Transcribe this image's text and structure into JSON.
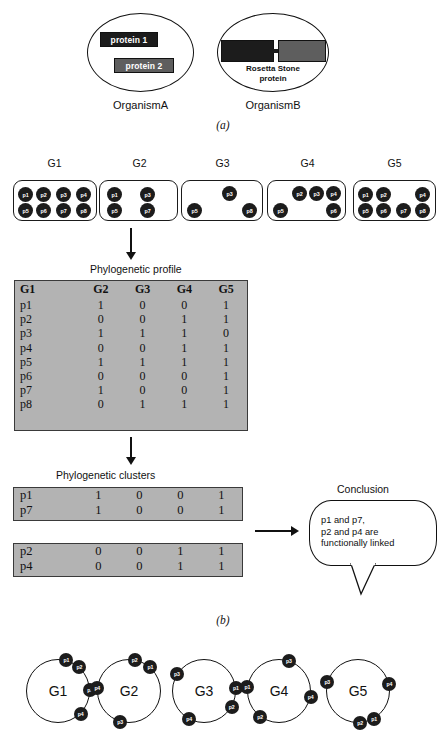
{
  "panel_a": {
    "caption": "(a)",
    "organism_a": {
      "label": "OrganismA",
      "proteins": [
        {
          "name": "protein 1",
          "shade": "#1c1c1c"
        },
        {
          "name": "protein 2",
          "shade": "#5e5e5e"
        }
      ]
    },
    "organism_b": {
      "label": "OrganismB",
      "fusion_label_line1": "Rosetta Stone",
      "fusion_label_line2": "protein",
      "segments": [
        {
          "shade": "#1c1c1c"
        },
        {
          "shade": "#5e5e5e"
        }
      ]
    }
  },
  "panel_b": {
    "caption": "(b)",
    "genomes": [
      {
        "name": "G1",
        "proteins": [
          "p1",
          "p2",
          "p3",
          "p4",
          "p5",
          "p6",
          "p7",
          "p8"
        ]
      },
      {
        "name": "G2",
        "proteins": [
          "p1",
          "p3",
          "p5",
          "p7"
        ]
      },
      {
        "name": "G3",
        "proteins": [
          "p3",
          "p5",
          "p8"
        ]
      },
      {
        "name": "G4",
        "proteins": [
          "p2",
          "p3",
          "p4",
          "p5",
          "p6"
        ]
      },
      {
        "name": "G5",
        "proteins": [
          "p1",
          "p2",
          "p4",
          "p5",
          "p6",
          "p7",
          "p8"
        ]
      }
    ],
    "profile_title": "Phylogenetic profile",
    "profile_table": {
      "headers": [
        "G1",
        "G2",
        "G3",
        "G4",
        "G5"
      ],
      "rows": [
        {
          "label": "p1",
          "values": [
            "1",
            "0",
            "0",
            "1"
          ]
        },
        {
          "label": "p2",
          "values": [
            "0",
            "0",
            "1",
            "1"
          ]
        },
        {
          "label": "p3",
          "values": [
            "1",
            "1",
            "1",
            "0"
          ]
        },
        {
          "label": "p4",
          "values": [
            "0",
            "0",
            "1",
            "1"
          ]
        },
        {
          "label": "p5",
          "values": [
            "1",
            "1",
            "1",
            "1"
          ]
        },
        {
          "label": "p6",
          "values": [
            "0",
            "0",
            "0",
            "1"
          ]
        },
        {
          "label": "p7",
          "values": [
            "1",
            "0",
            "0",
            "1"
          ]
        },
        {
          "label": "p8",
          "values": [
            "0",
            "1",
            "1",
            "1"
          ]
        }
      ]
    },
    "clusters_title": "Phylogenetic  clusters",
    "clusters": [
      {
        "rows": [
          {
            "label": "p1",
            "values": [
              "1",
              "0",
              "0",
              "1"
            ]
          },
          {
            "label": "p7",
            "values": [
              "1",
              "0",
              "0",
              "1"
            ]
          }
        ]
      },
      {
        "rows": [
          {
            "label": "p2",
            "values": [
              "0",
              "0",
              "1",
              "1"
            ]
          },
          {
            "label": "p4",
            "values": [
              "0",
              "0",
              "1",
              "1"
            ]
          }
        ]
      }
    ],
    "conclusion": {
      "title": "Conclusion",
      "line1": "p1 and p7,",
      "line2": "p2 and p4 are",
      "line3": "functionally linked"
    }
  },
  "panel_c": {
    "genomes": [
      {
        "name": "G1",
        "proteins": [
          {
            "label": "p1",
            "angle": -75
          },
          {
            "label": "p2",
            "angle": -48
          },
          {
            "label": "p3",
            "angle": -2
          },
          {
            "label": "p4",
            "angle": 45
          }
        ]
      },
      {
        "name": "G2",
        "proteins": [
          {
            "label": "p2",
            "angle": -80
          },
          {
            "label": "p1",
            "angle": -48
          },
          {
            "label": "p4",
            "angle": 186
          },
          {
            "label": "p3",
            "angle": 106
          }
        ]
      },
      {
        "name": "G3",
        "proteins": [
          {
            "label": "p3",
            "angle": 212
          },
          {
            "label": "p1",
            "angle": -6
          },
          {
            "label": "p2",
            "angle": 30
          },
          {
            "label": "p4",
            "angle": 118
          }
        ]
      },
      {
        "name": "G4",
        "proteins": [
          {
            "label": "p3",
            "angle": -72
          },
          {
            "label": "p4",
            "angle": 10
          },
          {
            "label": "p1",
            "angle": 188
          },
          {
            "label": "p2",
            "angle": 126
          }
        ]
      },
      {
        "name": "G5",
        "proteins": [
          {
            "label": "p3",
            "angle": 196
          },
          {
            "label": "p4",
            "angle": -12
          },
          {
            "label": "p1",
            "angle": 60
          },
          {
            "label": "p2",
            "angle": 86
          }
        ]
      }
    ]
  },
  "colors": {
    "table_fill": "#b3b3b3",
    "ink": "#111111",
    "dot_fill": "#1c1c1c"
  }
}
